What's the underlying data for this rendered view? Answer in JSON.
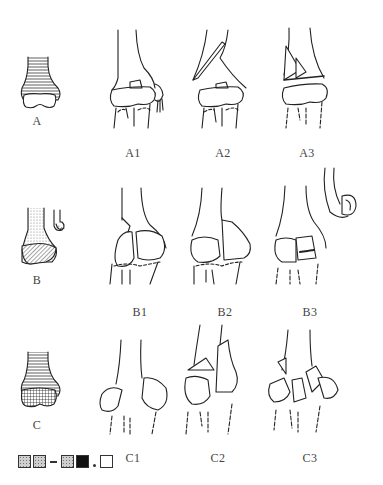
{
  "figure": {
    "rows": [
      {
        "type_label": "A",
        "subgroups": [
          "A1",
          "A2",
          "A3"
        ]
      },
      {
        "type_label": "B",
        "subgroups": [
          "B1",
          "B2",
          "B3"
        ]
      },
      {
        "type_label": "C",
        "subgroups": [
          "C1",
          "C2",
          "C3"
        ]
      }
    ],
    "legend": {
      "swatches": [
        "stippled",
        "stippled",
        "dash",
        "stippled",
        "black",
        "dot",
        "white"
      ]
    },
    "colors": {
      "line": "#222222",
      "label": "#444444",
      "background": "#ffffff"
    }
  }
}
